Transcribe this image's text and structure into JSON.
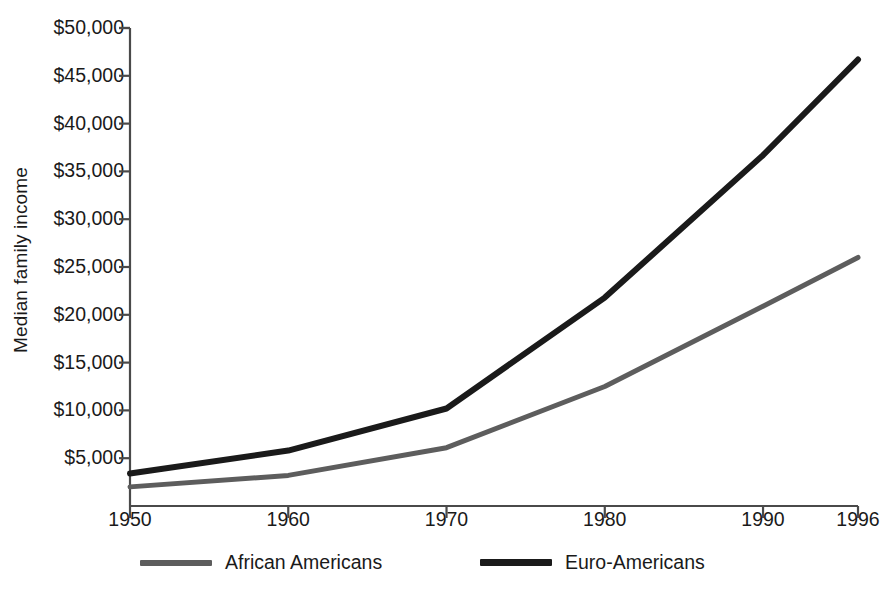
{
  "chart_data": {
    "type": "line",
    "title": "",
    "xlabel": "",
    "ylabel": "Median family income",
    "x": [
      1950,
      1960,
      1970,
      1980,
      1990,
      1996
    ],
    "xtick_labels": [
      "1950",
      "1960",
      "1970",
      "1980",
      "1990",
      "1996"
    ],
    "ytick_labels": [
      "$5,000",
      "$10,000",
      "$15,000",
      "$20,000",
      "$25,000",
      "$30,000",
      "$35,000",
      "$40,000",
      "$45,000",
      "$50,000"
    ],
    "ytick_values": [
      5000,
      10000,
      15000,
      20000,
      25000,
      30000,
      35000,
      40000,
      45000,
      50000
    ],
    "ylim": [
      0,
      50000
    ],
    "xlim": [
      1950,
      1996
    ],
    "grid": false,
    "legend_position": "below-axis",
    "series": [
      {
        "name": "African Americans",
        "color": "#5d5d5d",
        "width": 5,
        "values": [
          2000,
          3200,
          6100,
          12500,
          20900,
          26000
        ]
      },
      {
        "name": "Euro-Americans",
        "color": "#1a1a1a",
        "width": 6,
        "values": [
          3400,
          5800,
          10200,
          21800,
          36700,
          46700
        ]
      }
    ]
  },
  "legend": {
    "items": [
      {
        "label": "African Americans",
        "color": "#5d5d5d"
      },
      {
        "label": "Euro-Americans",
        "color": "#1a1a1a"
      }
    ]
  },
  "axes": {
    "line_color": "#4a4a4a"
  }
}
